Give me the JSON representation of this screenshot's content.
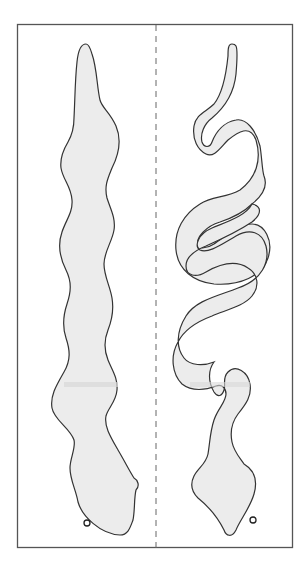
{
  "diagram": {
    "frame": {
      "x": 17,
      "y": 24,
      "width": 276,
      "height": 524,
      "stroke": "#555555"
    },
    "divider": {
      "x": 156,
      "style": "dashed",
      "stroke": "#666666"
    },
    "colors": {
      "fill": "#ececec",
      "outline": "#333333",
      "band": "#d9d9d9",
      "background": "#ffffff"
    },
    "panels": [
      {
        "id": "left",
        "label": "Straight snake cutout",
        "shape": "snake-straight",
        "marker": {
          "cx": 87,
          "cy": 523,
          "r": 3
        }
      },
      {
        "id": "right",
        "label": "Coiled snake cutout",
        "shape": "snake-coiled",
        "marker": {
          "cx": 253,
          "cy": 520,
          "r": 3
        }
      }
    ],
    "fold_band_y": 298
  }
}
